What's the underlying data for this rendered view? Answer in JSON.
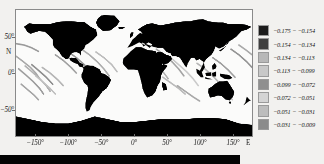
{
  "figure": {
    "background_color": "#f2f1ef",
    "panel_background": "#fbfbfa",
    "land_color": "#000000",
    "frame_color": "#8a8a8a"
  },
  "axes": {
    "x_label_suffix": "E",
    "y_label_letter": "N",
    "x_ticks": [
      {
        "value": -150,
        "label": "−150°"
      },
      {
        "value": -100,
        "label": "−100°"
      },
      {
        "value": -50,
        "label": "−50°"
      },
      {
        "value": 0,
        "label": "0°"
      },
      {
        "value": 50,
        "label": "50°"
      },
      {
        "value": 100,
        "label": "100°"
      },
      {
        "value": 150,
        "label": "150°"
      }
    ],
    "y_ticks": [
      {
        "value": 50,
        "label": "50°"
      },
      {
        "value": 0,
        "label": "0°"
      },
      {
        "value": -50,
        "label": "−50°"
      }
    ],
    "x_range": [
      -180,
      180
    ],
    "y_range": [
      -90,
      90
    ]
  },
  "legend": {
    "position": "right",
    "entries": [
      {
        "label": "−0.175 − −0.154",
        "min": -0.175,
        "max": -0.154,
        "color": "#1c1c1c"
      },
      {
        "label": "−0.154 − −0.134",
        "min": -0.154,
        "max": -0.134,
        "color": "#3f3f3f"
      },
      {
        "label": "−0.134 − −0.113",
        "min": -0.134,
        "max": -0.113,
        "color": "#b8b8b8"
      },
      {
        "label": "−0.113 − −0.099",
        "min": -0.113,
        "max": -0.099,
        "color": "#c8c8c8"
      },
      {
        "label": "−0.099 − −0.072",
        "min": -0.099,
        "max": -0.072,
        "color": "#8f8f8f"
      },
      {
        "label": "−0.072 − −0.051",
        "min": -0.072,
        "max": -0.051,
        "color": "#d4d4d4"
      },
      {
        "label": "−0.051 − −0.031",
        "min": -0.051,
        "max": -0.031,
        "color": "#bdbdbd"
      },
      {
        "label": "−0.031 − −0.009",
        "min": -0.031,
        "max": -0.009,
        "color": "#8b8b8b"
      }
    ]
  },
  "chart_data": {
    "type": "map",
    "title": "",
    "xlabel": "",
    "ylabel": "",
    "projection": "equirectangular",
    "xlim": [
      -180,
      180
    ],
    "ylim": [
      -90,
      90
    ],
    "grid": false,
    "land_fill": "#000000",
    "ocean_fill": "#fbfbfa",
    "series": [
      {
        "name": "ground-track-segments",
        "description": "Grayscale satellite ground-track arcs over ocean, shaded by value class",
        "tracks": [
          {
            "points": [
              [
                -180,
                42
              ],
              [
                -168,
                40
              ],
              [
                -156,
                36
              ],
              [
                -146,
                31
              ]
            ],
            "color": "#9a9a9a"
          },
          {
            "points": [
              [
                -180,
                24
              ],
              [
                -170,
                17
              ],
              [
                -158,
                8
              ],
              [
                -150,
                0
              ],
              [
                -144,
                -8
              ]
            ],
            "color": "#a8a8a8"
          },
          {
            "points": [
              [
                -176,
                6
              ],
              [
                -166,
                -2
              ],
              [
                -154,
                -12
              ],
              [
                -144,
                -22
              ],
              [
                -138,
                -30
              ]
            ],
            "color": "#9d9d9d"
          },
          {
            "points": [
              [
                -166,
                10
              ],
              [
                -156,
                2
              ],
              [
                -144,
                -8
              ],
              [
                -134,
                -18
              ],
              [
                -128,
                -26
              ]
            ],
            "color": "#b0b0b0"
          },
          {
            "points": [
              [
                -156,
                12
              ],
              [
                -146,
                4
              ],
              [
                -134,
                -6
              ],
              [
                -124,
                -16
              ]
            ],
            "color": "#8f8f8f"
          },
          {
            "points": [
              [
                -172,
                -16
              ],
              [
                -162,
                -24
              ],
              [
                -152,
                -32
              ],
              [
                -146,
                -38
              ]
            ],
            "color": "#a5a5a5"
          },
          {
            "points": [
              [
                -150,
                -4
              ],
              [
                -140,
                -12
              ],
              [
                -128,
                -22
              ],
              [
                -120,
                -30
              ]
            ],
            "color": "#c0c0c0"
          },
          {
            "points": [
              [
                -140,
                8
              ],
              [
                -128,
                0
              ],
              [
                -116,
                -10
              ],
              [
                -108,
                -18
              ]
            ],
            "color": "#b5b5b5"
          },
          {
            "points": [
              [
                -120,
                26
              ],
              [
                -108,
                18
              ],
              [
                -96,
                8
              ],
              [
                -88,
                0
              ]
            ],
            "color": "#a0a0a0"
          },
          {
            "points": [
              [
                -100,
                30
              ],
              [
                -88,
                22
              ],
              [
                -76,
                12
              ],
              [
                -66,
                2
              ],
              [
                -58,
                -6
              ]
            ],
            "color": "#989898"
          },
          {
            "points": [
              [
                -80,
                34
              ],
              [
                -68,
                26
              ],
              [
                -56,
                16
              ],
              [
                -46,
                6
              ],
              [
                -38,
                -4
              ]
            ],
            "color": "#adadad"
          },
          {
            "points": [
              [
                -58,
                30
              ],
              [
                -46,
                22
              ],
              [
                -34,
                12
              ],
              [
                -26,
                2
              ]
            ],
            "color": "#bdbdbd"
          },
          {
            "points": [
              [
                10,
                30
              ],
              [
                22,
                22
              ],
              [
                34,
                12
              ],
              [
                44,
                2
              ],
              [
                52,
                -8
              ]
            ],
            "color": "#b2b2b2"
          },
          {
            "points": [
              [
                34,
                34
              ],
              [
                46,
                26
              ],
              [
                58,
                16
              ],
              [
                68,
                6
              ],
              [
                76,
                -4
              ]
            ],
            "color": "#a4a4a4"
          },
          {
            "points": [
              [
                56,
                22
              ],
              [
                68,
                12
              ],
              [
                80,
                2
              ],
              [
                90,
                -8
              ],
              [
                98,
                -18
              ]
            ],
            "color": "#cacaca"
          },
          {
            "points": [
              [
                44,
                -6
              ],
              [
                56,
                -14
              ],
              [
                68,
                -22
              ],
              [
                78,
                -30
              ]
            ],
            "color": "#bbbbbb"
          },
          {
            "points": [
              [
                66,
                -18
              ],
              [
                78,
                -26
              ],
              [
                90,
                -34
              ],
              [
                100,
                -40
              ]
            ],
            "color": "#a8a8a8"
          },
          {
            "points": [
              [
                96,
                14
              ],
              [
                108,
                6
              ],
              [
                120,
                -4
              ],
              [
                130,
                -14
              ]
            ],
            "color": "#b6b6b6"
          },
          {
            "points": [
              [
                120,
                22
              ],
              [
                132,
                14
              ],
              [
                144,
                4
              ],
              [
                154,
                -6
              ]
            ],
            "color": "#9f9f9f"
          },
          {
            "points": [
              [
                148,
                34
              ],
              [
                160,
                26
              ],
              [
                172,
                16
              ],
              [
                180,
                8
              ]
            ],
            "color": "#949494"
          },
          {
            "points": [
              [
                160,
                40
              ],
              [
                172,
                32
              ],
              [
                180,
                26
              ]
            ],
            "color": "#a9a9a9"
          },
          {
            "points": [
              [
                126,
                -22
              ],
              [
                138,
                -30
              ],
              [
                150,
                -38
              ]
            ],
            "color": "#c2c2c2"
          }
        ]
      }
    ]
  },
  "bottom_bar": {
    "color": "#040404"
  }
}
